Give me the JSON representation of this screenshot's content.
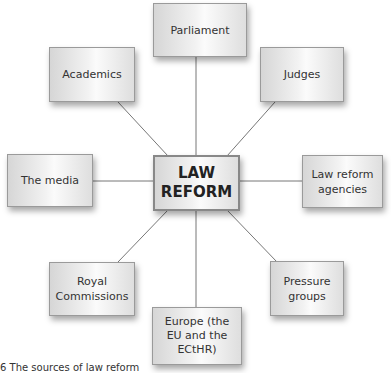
{
  "diagram": {
    "center": {
      "line1": "LAW",
      "line2": "REFORM"
    },
    "nodes": [
      {
        "id": "parliament",
        "lines": [
          "Parliament"
        ]
      },
      {
        "id": "academics",
        "lines": [
          "Academics"
        ]
      },
      {
        "id": "judges",
        "lines": [
          "Judges"
        ]
      },
      {
        "id": "media",
        "lines": [
          "The media"
        ]
      },
      {
        "id": "agencies",
        "lines": [
          "Law reform",
          "agencies"
        ]
      },
      {
        "id": "royal",
        "lines": [
          "Royal",
          "Commissions"
        ]
      },
      {
        "id": "pressure",
        "lines": [
          "Pressure",
          "groups"
        ]
      },
      {
        "id": "europe",
        "lines": [
          "Europe (the",
          "EU and the",
          "ECtHR)"
        ]
      }
    ]
  },
  "caption": "6 The sources of law reform"
}
